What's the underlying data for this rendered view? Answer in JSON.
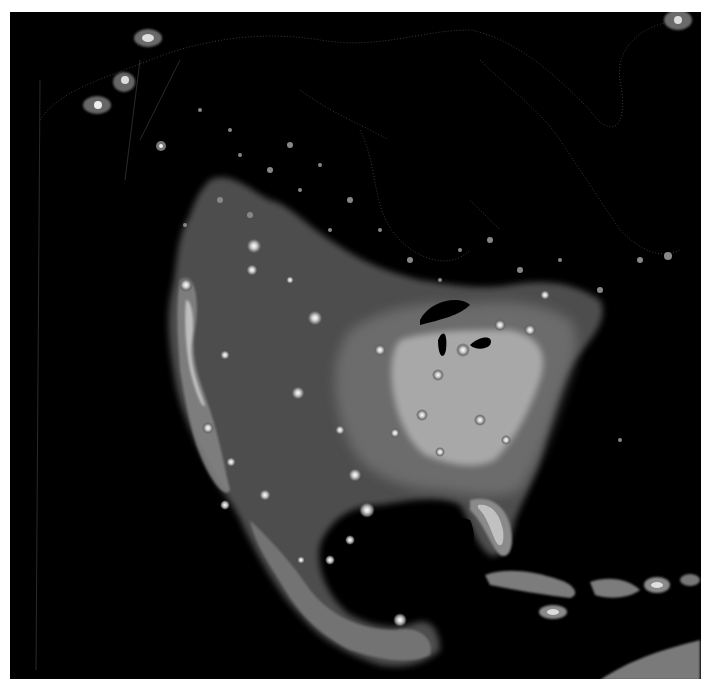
{
  "map": {
    "type": "satellite-night-lights",
    "region": "North America",
    "background_color": "#000000",
    "page_color": "#ffffff",
    "glow_colors": {
      "outer_halo": "#5a5a5a",
      "mid_glow": "#8c8c8c",
      "bright_core": "#e6e6e6",
      "city_core": "#ffffff"
    },
    "features": [
      {
        "name": "Alaska",
        "label": ""
      },
      {
        "name": "Canada",
        "label": ""
      },
      {
        "name": "United States",
        "label": ""
      },
      {
        "name": "Mexico",
        "label": ""
      },
      {
        "name": "Caribbean",
        "label": ""
      },
      {
        "name": "Greenland",
        "label": ""
      }
    ]
  }
}
